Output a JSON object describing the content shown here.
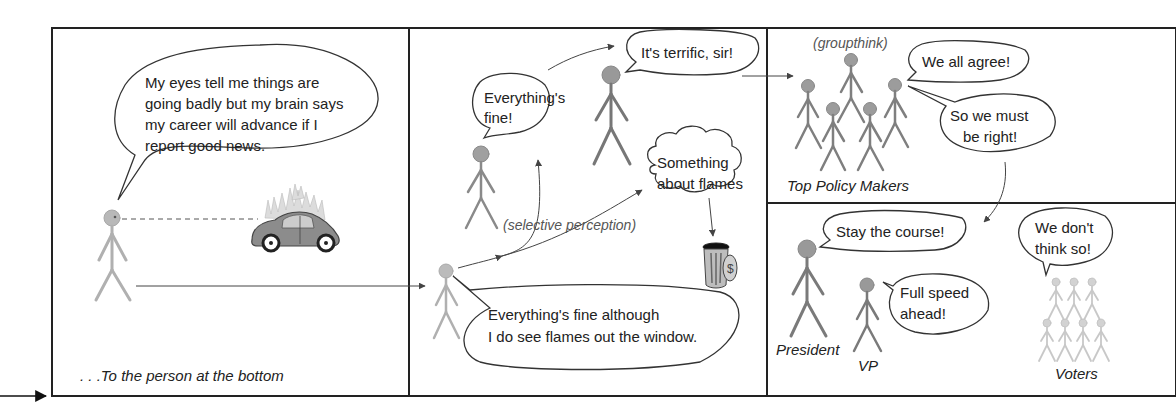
{
  "panels": {
    "panel1": {
      "speech": [
        "My eyes tell me things are",
        "going badly but my brain says",
        "my career will advance if I",
        "report good news."
      ],
      "caption": ". . .To the person at the bottom"
    },
    "panel2": {
      "bottom_speech": [
        "Everything's fine although",
        "I do see flames out the window."
      ],
      "middle_speech": [
        "Everything's",
        "fine!"
      ],
      "top_speech": "It's terrific, sir!",
      "thought": [
        "Something",
        "about flames"
      ],
      "label": "(selective perception)"
    },
    "panel3": {
      "label": "(groupthink)",
      "speech1": "We all agree!",
      "speech2": [
        "So we must",
        "be right!"
      ],
      "caption": "Top Policy Makers"
    },
    "panel4": {
      "president_speech": "Stay the course!",
      "vp_speech": [
        "Full speed",
        "ahead!"
      ],
      "voters_speech": [
        "We don't",
        "think so!"
      ],
      "labels": {
        "president": "President",
        "vp": "VP",
        "voters": "Voters"
      }
    }
  },
  "colors": {
    "border": "#222222",
    "figure_dark": "#7a7a7a",
    "figure_light": "#b0b0b0",
    "figure_faint": "#c8c8c8",
    "head_fill": "#9a9a9a",
    "car_body": "#8c8c8c",
    "flame": "#d8d8d8"
  }
}
